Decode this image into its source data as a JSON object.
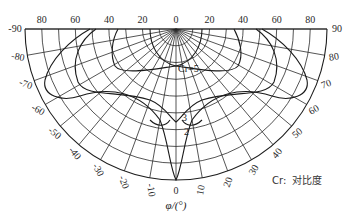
{
  "diagram": {
    "type": "polar iso-contrast diagram (half view)",
    "center": [
      176,
      29
    ],
    "radius": 151,
    "theta_ticks": [
      10,
      20,
      30,
      40,
      50,
      60,
      70,
      80
    ],
    "phi_ticks": [
      -90,
      -80,
      -70,
      -60,
      -50,
      -40,
      -30,
      -20,
      -10,
      0,
      10,
      20,
      30,
      40,
      50,
      60,
      70,
      80,
      90
    ],
    "top_labels": [
      "80",
      "60",
      "40",
      "20",
      "0",
      "20",
      "40",
      "60",
      "80"
    ],
    "left_labels": [
      "-90",
      "-80",
      "-70",
      "-60",
      "-50",
      "-40",
      "-30",
      "-20",
      "-10"
    ],
    "right_labels": [
      "90",
      "80",
      "70",
      "60",
      "50",
      "40",
      "30",
      "20",
      "10"
    ],
    "bottom_center_label": "0",
    "axis_title": "φ/(°)",
    "contour_labels": {
      "c5": "Cr=5",
      "c3": "3",
      "c2": "2"
    },
    "legend": {
      "symbol": "Cr:",
      "text": "对比度"
    }
  },
  "chart_data": {
    "type": "polar-contour",
    "title": "",
    "quantity": "Cr (contrast ratio)",
    "legend": "Cr: 对比度",
    "radial_axis": {
      "name": "θ",
      "unit": "°",
      "ticks": [
        0,
        20,
        40,
        60,
        80
      ],
      "range": [
        0,
        90
      ]
    },
    "angular_axis": {
      "name": "φ",
      "unit": "°",
      "label": "φ/(°)",
      "ticks": [
        -90,
        -80,
        -70,
        -60,
        -50,
        -40,
        -30,
        -20,
        -10,
        0,
        10,
        20,
        30,
        40,
        50,
        60,
        70,
        80,
        90
      ],
      "range": [
        -90,
        90
      ]
    },
    "contours": [
      {
        "level": 5,
        "label": "Cr=5"
      },
      {
        "level": 3,
        "label": "3"
      },
      {
        "level": 2,
        "label": "2"
      }
    ]
  }
}
